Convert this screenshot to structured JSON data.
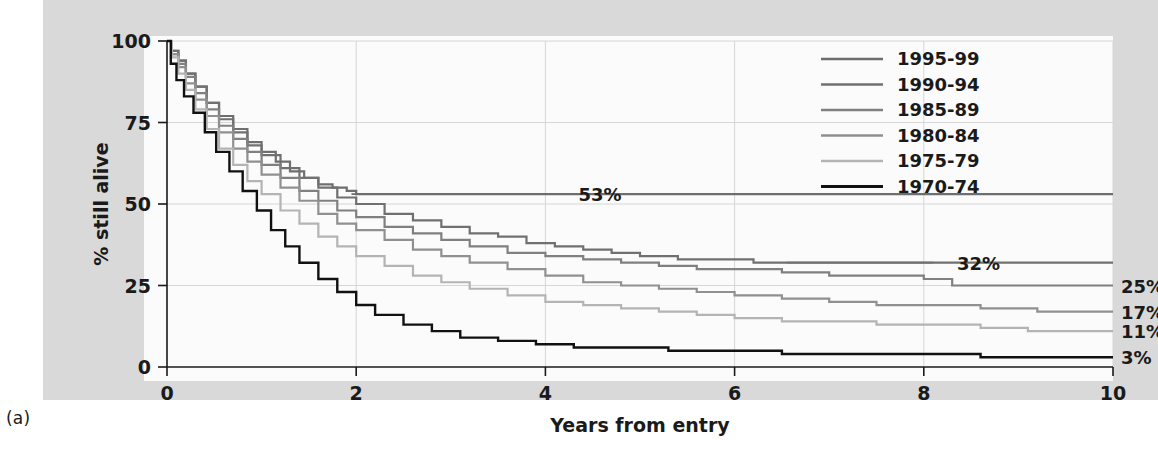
{
  "figure": {
    "panel_label": "(a)",
    "background_color": "#d9d9d9",
    "plot_background_color": "#fbfbfb"
  },
  "chart_data": {
    "type": "line",
    "title": "",
    "subtitle": "",
    "xlabel": "Years from entry",
    "ylabel": "% still alive",
    "xlim": [
      0,
      10
    ],
    "ylim": [
      0,
      100
    ],
    "xticks": [
      0,
      2,
      4,
      6,
      8,
      10
    ],
    "xtick_labels": [
      "0",
      "2",
      "4",
      "6",
      "8",
      "10"
    ],
    "yticks": [
      0,
      25,
      50,
      75,
      100
    ],
    "ytick_labels": [
      "0",
      "25",
      "50",
      "75",
      "100"
    ],
    "grid": true,
    "grid_color": "#d6d6d6",
    "step": "post",
    "legend_position": "top-right",
    "series": [
      {
        "name": "1995-99",
        "color": "#6e6e6e",
        "width": 2.2,
        "end_label": "53%",
        "x": [
          0,
          0.05,
          0.12,
          0.2,
          0.3,
          0.42,
          0.55,
          0.7,
          0.85,
          1.0,
          1.15,
          1.3,
          1.45,
          1.6,
          1.75,
          1.9,
          2.0
        ],
        "y": [
          100,
          97,
          94,
          90,
          86,
          81,
          77,
          73,
          69,
          66,
          63,
          60,
          58,
          56,
          55,
          54,
          53
        ]
      },
      {
        "name": "1990-94",
        "color": "#707070",
        "width": 2.2,
        "end_label": "32%",
        "x": [
          0,
          0.05,
          0.12,
          0.2,
          0.3,
          0.42,
          0.55,
          0.7,
          0.85,
          1.0,
          1.2,
          1.4,
          1.6,
          1.8,
          2.0,
          2.3,
          2.6,
          2.9,
          3.2,
          3.5,
          3.8,
          4.1,
          4.4,
          4.7,
          5.0,
          5.4,
          5.8,
          6.2,
          6.6
        ],
        "y": [
          100,
          97,
          94,
          90,
          86,
          81,
          76,
          72,
          68,
          65,
          61,
          58,
          55,
          52,
          50,
          47,
          45,
          43,
          41,
          40,
          38,
          37,
          36,
          35,
          34,
          33,
          33,
          32,
          32
        ]
      },
      {
        "name": "1985-89",
        "color": "#808080",
        "width": 2.2,
        "end_label": "25%",
        "x": [
          0,
          0.05,
          0.12,
          0.2,
          0.3,
          0.42,
          0.55,
          0.7,
          0.85,
          1.0,
          1.2,
          1.4,
          1.6,
          1.8,
          2.0,
          2.3,
          2.6,
          2.9,
          3.2,
          3.6,
          4.0,
          4.4,
          4.8,
          5.2,
          5.6,
          6.0,
          6.5,
          7.0,
          7.5,
          8.0,
          8.3,
          9.0,
          10.0
        ],
        "y": [
          100,
          96,
          93,
          89,
          84,
          79,
          74,
          70,
          66,
          62,
          58,
          54,
          51,
          48,
          46,
          43,
          41,
          39,
          37,
          35,
          34,
          33,
          32,
          31,
          30,
          30,
          29,
          28,
          28,
          27,
          25,
          25,
          25
        ]
      },
      {
        "name": "1980-84",
        "color": "#909090",
        "width": 2.2,
        "end_label": "17%",
        "x": [
          0,
          0.05,
          0.12,
          0.2,
          0.3,
          0.42,
          0.55,
          0.7,
          0.85,
          1.0,
          1.2,
          1.4,
          1.6,
          1.8,
          2.0,
          2.3,
          2.6,
          2.9,
          3.2,
          3.6,
          4.0,
          4.4,
          4.8,
          5.2,
          5.6,
          6.0,
          6.5,
          7.0,
          7.5,
          8.0,
          8.6,
          9.2,
          10.0
        ],
        "y": [
          100,
          96,
          92,
          87,
          82,
          77,
          72,
          67,
          63,
          59,
          55,
          51,
          47,
          44,
          42,
          39,
          36,
          34,
          32,
          30,
          28,
          26,
          25,
          24,
          23,
          22,
          21,
          20,
          19,
          19,
          18,
          17,
          17
        ]
      },
      {
        "name": "1975-79",
        "color": "#b4b4b4",
        "width": 2.2,
        "end_label": "11%",
        "x": [
          0,
          0.05,
          0.12,
          0.2,
          0.3,
          0.42,
          0.55,
          0.7,
          0.85,
          1.0,
          1.2,
          1.4,
          1.6,
          1.8,
          2.0,
          2.3,
          2.6,
          2.9,
          3.2,
          3.6,
          4.0,
          4.4,
          4.8,
          5.2,
          5.6,
          6.0,
          6.5,
          7.0,
          7.5,
          8.0,
          8.6,
          9.1,
          10.0
        ],
        "y": [
          100,
          95,
          90,
          85,
          79,
          73,
          67,
          62,
          57,
          53,
          48,
          44,
          40,
          37,
          34,
          31,
          28,
          26,
          24,
          22,
          20,
          19,
          18,
          17,
          16,
          15,
          14,
          14,
          13,
          13,
          12,
          11,
          11
        ]
      },
      {
        "name": "1970-74",
        "color": "#111111",
        "width": 2.4,
        "end_label": "3%",
        "x": [
          0,
          0.04,
          0.1,
          0.18,
          0.28,
          0.4,
          0.52,
          0.66,
          0.8,
          0.95,
          1.1,
          1.25,
          1.4,
          1.6,
          1.8,
          2.0,
          2.2,
          2.5,
          2.8,
          3.1,
          3.5,
          3.9,
          4.3,
          4.8,
          5.3,
          5.9,
          6.5,
          7.2,
          8.0,
          8.6,
          9.2,
          10.0
        ],
        "y": [
          100,
          93,
          88,
          83,
          78,
          72,
          66,
          60,
          54,
          48,
          42,
          37,
          32,
          27,
          23,
          19,
          16,
          13,
          11,
          9,
          8,
          7,
          6,
          6,
          5,
          5,
          4,
          4,
          4,
          3,
          3,
          3
        ]
      }
    ],
    "annotations": [
      {
        "label": "53%",
        "series": "1995-99",
        "leader_from_x": 1.95,
        "leader_from_y": 53,
        "leader_to_x": 4.1,
        "leader_to_y": 53,
        "text_x": 4.35,
        "text_y": 53
      },
      {
        "label": "32%",
        "series": "1990-94",
        "leader_from_x": 6.55,
        "leader_from_y": 32,
        "leader_to_x": 8.1,
        "leader_to_y": 32,
        "text_x": 8.35,
        "text_y": 32
      }
    ],
    "end_labels": [
      {
        "label": "25%",
        "series": "1985-89",
        "y": 25
      },
      {
        "label": "17%",
        "series": "1980-84",
        "y": 17
      },
      {
        "label": "11%",
        "series": "1975-79",
        "y": 11
      },
      {
        "label": "3%",
        "series": "1970-74",
        "y": 3
      }
    ]
  }
}
